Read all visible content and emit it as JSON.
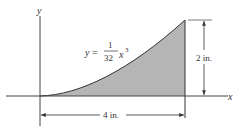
{
  "diagram": {
    "axes": {
      "x_label": "x",
      "y_label": "y"
    },
    "curve": {
      "equation_prefix": "y =",
      "numerator": "1",
      "denominator": "32",
      "variable": "x",
      "exponent": "3"
    },
    "dimensions": {
      "height": "2 in.",
      "width": "4 in."
    },
    "colors": {
      "fill": "#b5b5b5",
      "line": "#333333"
    }
  }
}
